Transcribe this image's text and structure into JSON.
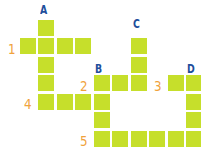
{
  "puzzle": {
    "type": "crossword-grid",
    "cell_color": "#c6df2b",
    "letter_color": "#1f4f9c",
    "number_color": "#f0a23c",
    "down_labels": [
      {
        "label": "A",
        "x": 40,
        "y": 3
      },
      {
        "label": "B",
        "x": 95,
        "y": 62
      },
      {
        "label": "C",
        "x": 133,
        "y": 17
      },
      {
        "label": "D",
        "x": 187,
        "y": 62
      }
    ],
    "across_labels": [
      {
        "label": "1",
        "x": 8,
        "y": 42
      },
      {
        "label": "2",
        "x": 80,
        "y": 79
      },
      {
        "label": "3",
        "x": 154,
        "y": 79
      },
      {
        "label": "4",
        "x": 24,
        "y": 97
      },
      {
        "label": "5",
        "x": 80,
        "y": 134
      }
    ],
    "entries": {
      "A": {
        "direction": "down",
        "length": 5
      },
      "B": {
        "direction": "down",
        "length": 4
      },
      "C": {
        "direction": "down",
        "length": 3
      },
      "D": {
        "direction": "down",
        "length": 4
      },
      "1": {
        "direction": "across",
        "length": 5
      },
      "2": {
        "direction": "across",
        "length": 3
      },
      "3": {
        "direction": "across",
        "length": 2
      },
      "4": {
        "direction": "across",
        "length": 4
      },
      "5": {
        "direction": "across",
        "length": 6
      }
    },
    "cells": [
      [
        38,
        20
      ],
      [
        20,
        38
      ],
      [
        38,
        38
      ],
      [
        57,
        38
      ],
      [
        75,
        38
      ],
      [
        38,
        57
      ],
      [
        131,
        38
      ],
      [
        131,
        57
      ],
      [
        38,
        75
      ],
      [
        94,
        75
      ],
      [
        112,
        75
      ],
      [
        131,
        75
      ],
      [
        168,
        75
      ],
      [
        186,
        75
      ],
      [
        38,
        94
      ],
      [
        57,
        94
      ],
      [
        75,
        94
      ],
      [
        94,
        94
      ],
      [
        186,
        94
      ],
      [
        94,
        112
      ],
      [
        186,
        112
      ],
      [
        94,
        131
      ],
      [
        112,
        131
      ],
      [
        131,
        131
      ],
      [
        149,
        131
      ],
      [
        168,
        131
      ],
      [
        186,
        131
      ]
    ]
  }
}
